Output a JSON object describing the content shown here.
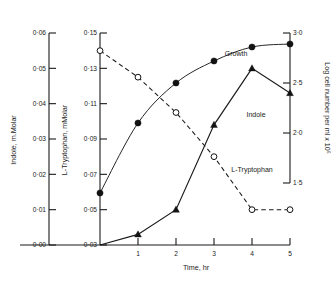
{
  "chart_data": {
    "type": "line",
    "title": "",
    "xlabel": "Time, hr",
    "x": [
      0,
      1,
      2,
      3,
      4,
      5
    ],
    "xlim": [
      0,
      5
    ],
    "xticks": [
      "1",
      "2",
      "3",
      "4",
      "5"
    ],
    "grid": false,
    "legend_position": "inline-labels",
    "axes": [
      {
        "id": "indole",
        "label": "Indole, m.Molar",
        "side": "left",
        "position": 1,
        "lim": [
          0.0,
          0.06
        ],
        "ticks": [
          "0·00",
          "0·01",
          "0·02",
          "0·03",
          "0·04",
          "0·05",
          "0·06"
        ],
        "tick_values": [
          0.0,
          0.01,
          0.02,
          0.03,
          0.04,
          0.05,
          0.06
        ]
      },
      {
        "id": "tryptophan",
        "label": "L-Tryptophan, mMolar",
        "side": "left",
        "position": 2,
        "lim": [
          0.03,
          0.15
        ],
        "ticks": [
          "0·03",
          "0·05",
          "0·07",
          "0·09",
          "0·11",
          "0·13",
          "0·15"
        ],
        "tick_values": [
          0.03,
          0.05,
          0.07,
          0.09,
          0.11,
          0.13,
          0.15
        ]
      },
      {
        "id": "growth",
        "label": "Log cell number per ml x 10⁶",
        "side": "right",
        "position": 1,
        "lim": [
          1.5,
          3.0
        ],
        "ticks": [
          "1·5",
          "2·0",
          "2·5",
          "3·0"
        ],
        "tick_values": [
          1.5,
          2.0,
          2.5,
          3.0
        ]
      }
    ],
    "series": [
      {
        "name": "Growth",
        "axis": "growth",
        "marker": "filled-circle",
        "line": "solid",
        "label_text": "Growth",
        "values": [
          1.4,
          2.1,
          2.5,
          2.72,
          2.86,
          2.89
        ]
      },
      {
        "name": "L-Tryptophan",
        "axis": "tryptophan",
        "marker": "open-circle",
        "line": "dashed",
        "label_text": "L-Tryptophan",
        "values": [
          0.14,
          0.125,
          0.105,
          0.08,
          0.05,
          0.05
        ]
      },
      {
        "name": "Indole",
        "axis": "indole",
        "marker": "filled-triangle",
        "line": "solid",
        "label_text": "Indole",
        "values": [
          0.0,
          0.003,
          0.01,
          0.034,
          0.05,
          0.043
        ]
      }
    ]
  },
  "labels": {
    "x_axis_title": "Time, hr",
    "indole_axis_title": "Indole, m.Molar",
    "tryptophan_axis_title": "L-Tryptophan, mMolar",
    "growth_axis_title": "Log cell number per ml x 10⁶",
    "growth_series": "Growth",
    "indole_series": "Indole",
    "tryptophan_series": "L-Tryptophan"
  },
  "colors": {
    "ink": "#1a1a1a",
    "background": "#ffffff"
  }
}
